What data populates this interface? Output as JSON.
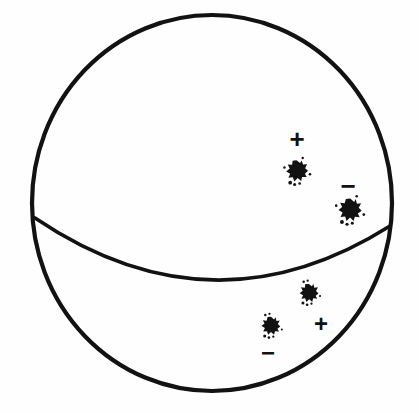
{
  "figure": {
    "background_color": "#fefefe",
    "ink_color": "#121212",
    "sphere": {
      "name": "sphere-outline",
      "center_x": 212,
      "center_y": 203,
      "radius_x": 180,
      "radius_y": 188,
      "stroke_width": 4.2
    },
    "equator": {
      "name": "equator-curve",
      "left_x": 35,
      "left_y": 218,
      "right_x": 390,
      "right_y": 226,
      "sag_depth": 58,
      "stroke_width": 3.6
    },
    "markers": [
      {
        "id": "northern-positive",
        "hemisphere": "northern",
        "sign": "+",
        "sign_label": "+",
        "sign_x": 297,
        "sign_y": 139,
        "sign_size": 26,
        "blob_x": 297,
        "blob_y": 171,
        "blob_size": 11
      },
      {
        "id": "northern-negative",
        "hemisphere": "northern",
        "sign": "-",
        "sign_label": "−",
        "sign_x": 348,
        "sign_y": 186,
        "sign_size": 26,
        "blob_x": 350,
        "blob_y": 210,
        "blob_size": 11.5
      },
      {
        "id": "southern-upper-blob",
        "hemisphere": "southern",
        "sign": "none",
        "sign_label": "",
        "sign_x": 0,
        "sign_y": 0,
        "sign_size": 0,
        "blob_x": 309,
        "blob_y": 293,
        "blob_size": 9.5
      },
      {
        "id": "southern-positive",
        "hemisphere": "southern",
        "sign": "+",
        "sign_label": "+",
        "sign_x": 321,
        "sign_y": 323,
        "sign_size": 24,
        "blob_x": 0,
        "blob_y": 0,
        "blob_size": 0
      },
      {
        "id": "southern-left-blob",
        "hemisphere": "southern",
        "sign": "none",
        "sign_label": "",
        "sign_x": 0,
        "sign_y": 0,
        "sign_size": 0,
        "blob_x": 271,
        "blob_y": 326,
        "blob_size": 9.5
      },
      {
        "id": "southern-negative",
        "hemisphere": "southern",
        "sign": "-",
        "sign_label": "−",
        "sign_x": 268,
        "sign_y": 352,
        "sign_size": 24,
        "blob_x": 0,
        "blob_y": 0,
        "blob_size": 0
      }
    ]
  }
}
